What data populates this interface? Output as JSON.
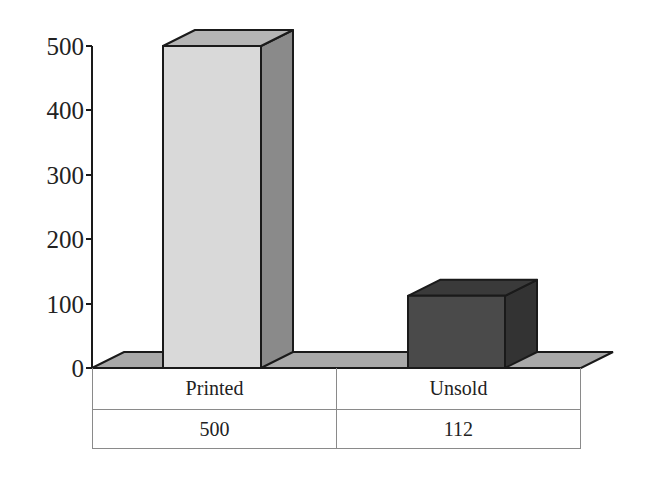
{
  "chart_data": {
    "type": "bar",
    "style": "3d",
    "title": "",
    "xlabel": "",
    "ylabel": "",
    "categories": [
      "Printed",
      "Unsold"
    ],
    "values": [
      500,
      112
    ],
    "ylim": [
      0,
      500
    ],
    "yticks": [
      "0",
      "100",
      "200",
      "300",
      "400",
      "500"
    ],
    "grid": false,
    "legend": null,
    "data_table": {
      "header": [
        "Printed",
        "Unsold"
      ],
      "values": [
        "500",
        "112"
      ]
    },
    "colors": {
      "Printed": "#d9d9d9",
      "Unsold": "#4a4a4a",
      "floor": "#a8a8a8"
    }
  }
}
